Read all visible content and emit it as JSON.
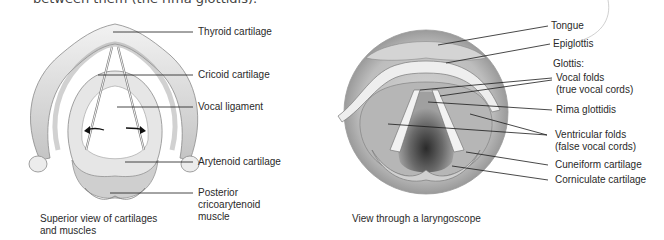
{
  "header": {
    "text": "between them (the rima glottidis)."
  },
  "left_figure": {
    "caption": "Superior view of cartilages and muscles",
    "caption_lines": [
      "Superior view of cartilages",
      "and muscles"
    ],
    "labels": [
      {
        "text": "Thyroid cartilage"
      },
      {
        "text": "Cricoid cartilage"
      },
      {
        "text": "Vocal ligament"
      },
      {
        "text": "Arytenoid cartilage"
      },
      {
        "text": "Posterior cricoarytenoid muscle",
        "lines": [
          "Posterior",
          "cricoarytenoid",
          "muscle"
        ]
      }
    ]
  },
  "right_figure": {
    "caption": "View through a laryngoscope",
    "labels": [
      {
        "text": "Tongue"
      },
      {
        "text": "Epiglottis"
      },
      {
        "text": "Glottis:"
      },
      {
        "text": "Vocal folds (true vocal cords)",
        "lines": [
          "Vocal folds",
          "(true vocal cords)"
        ]
      },
      {
        "text": "Rima glottidis"
      },
      {
        "text": "Ventricular folds (false vocal cords)",
        "lines": [
          "Ventricular folds",
          "(false vocal cords)"
        ]
      },
      {
        "text": "Cuneiform cartilage"
      },
      {
        "text": "Corniculate cartilage"
      }
    ]
  },
  "colors": {
    "leader_line": "#1a1a1a",
    "label_text": "#2a2a2a",
    "shading_light": "#e8e8e8",
    "shading_mid": "#bdbdbd",
    "shading_dark": "#5a5a5a"
  }
}
